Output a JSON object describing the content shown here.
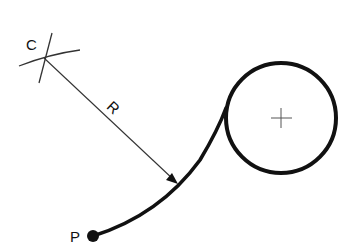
{
  "diagram": {
    "labels": {
      "center": "C",
      "radius": "R",
      "point": "P"
    },
    "colors": {
      "stroke": "#111111",
      "thin": "#333333",
      "background": "#ffffff"
    }
  }
}
